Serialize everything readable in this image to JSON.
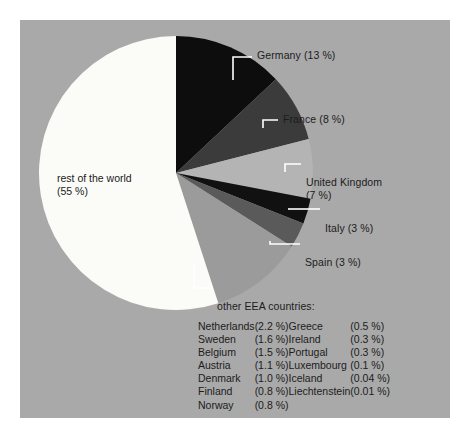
{
  "figure": {
    "background_color": "#ffffff",
    "panel_color": "#a9a9a9"
  },
  "chart_data": {
    "type": "pie",
    "title": "",
    "unit": "%",
    "categories": [
      "rest of the world",
      "Germany",
      "France",
      "United Kingdom",
      "Italy",
      "Spain",
      "other EEA countries"
    ],
    "values": [
      55,
      13,
      8,
      7,
      3,
      3,
      11
    ],
    "colors": [
      "#fbfbf7",
      "#0d0d0d",
      "#3b3b3b",
      "#b4b4b4",
      "#111111",
      "#5a5a5a",
      "#9b9b9b"
    ],
    "legend_position": "callouts",
    "labels": {
      "rest_of_world_line1": "rest of the world",
      "rest_of_world_line2": "(55 %)",
      "germany": "Germany (13 %)",
      "france": "France (8 %)",
      "uk_line1": "United Kingdom",
      "uk_line2": "(7 %)",
      "italy": "Italy (3 %)",
      "spain": "Spain (3 %)",
      "other_eea": "other EEA countries:"
    },
    "other_eea_breakdown": {
      "column_left": [
        {
          "country": "Netherlands",
          "value": "(2.2 %)"
        },
        {
          "country": "Sweden",
          "value": "(1.6 %)"
        },
        {
          "country": "Belgium",
          "value": "(1.5 %)"
        },
        {
          "country": "Austria",
          "value": "(1.1 %)"
        },
        {
          "country": "Denmark",
          "value": "(1.0 %)"
        },
        {
          "country": "Finland",
          "value": "(0.8 %)"
        },
        {
          "country": "Norway",
          "value": "(0.8 %)"
        }
      ],
      "column_right": [
        {
          "country": "Greece",
          "value": "(0.5 %)"
        },
        {
          "country": "Ireland",
          "value": "(0.3 %)"
        },
        {
          "country": "Portugal",
          "value": "(0.3 %)"
        },
        {
          "country": "Luxembourg",
          "value": "(0.1 %)"
        },
        {
          "country": "Iceland",
          "value": "(0.04 %)"
        },
        {
          "country": "Liechtenstein",
          "value": "(0.01 %)"
        },
        {
          "country": "",
          "value": ""
        }
      ]
    }
  }
}
